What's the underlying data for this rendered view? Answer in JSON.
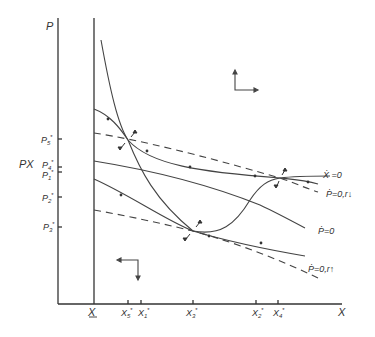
{
  "diagram": {
    "axes": {
      "y_label": "P",
      "x_label": "X",
      "px_label": "PX",
      "x_lower_bound_label": "X",
      "y_ticks": [
        {
          "label": "P",
          "sub": "5",
          "sup": "*"
        },
        {
          "label": "P",
          "sub": "4",
          "sup": "*"
        },
        {
          "label": "P",
          "sub": "1",
          "sup": "*"
        },
        {
          "label": "P",
          "sub": "2",
          "sup": "*"
        },
        {
          "label": "P",
          "sub": "3",
          "sup": "*"
        }
      ],
      "x_ticks": [
        {
          "label": "X",
          "sub": "5",
          "sup": "*"
        },
        {
          "label": "X",
          "sub": "1",
          "sup": "*"
        },
        {
          "label": "X",
          "sub": "3",
          "sup": "*"
        },
        {
          "label": "X",
          "sub": "2",
          "sup": "*"
        },
        {
          "label": "X",
          "sub": "4",
          "sup": "*"
        }
      ]
    },
    "curve_labels": {
      "x_dot_zero": "Ẋ =0",
      "p_dot_zero_r_down": "Ṗ=0,r↓",
      "p_dot_zero": "Ṗ=0",
      "p_dot_zero_r_up": "Ṗ=0,r↑"
    },
    "direction_indicators": {
      "upper_right": "up-right",
      "lower_left": "left-down"
    }
  }
}
